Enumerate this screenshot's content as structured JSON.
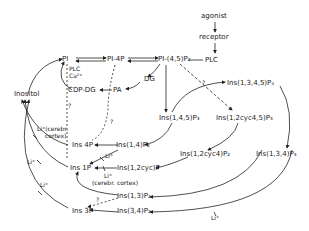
{
  "diagram": {
    "type": "metabolic-pathway",
    "nodes": {
      "agonist": "agonist",
      "receptor": "receptor",
      "plc": "PLC",
      "pi": "PI",
      "pi4p": "PI-4P",
      "pip2": "PI-(4,5)P₂",
      "plc_ca_1": "PLC",
      "plc_ca_2": "Ca²⁺",
      "cdp_dg": "CDP-DG",
      "pa": "PA",
      "dg": "DG",
      "inositol": "Inositol",
      "ins1345p4": "Ins(1,3,4,5)P₄",
      "ins145p3": "Ins(1,4,5)P₃",
      "ins12cyc45p3": "Ins(1,2cyc4,5)P₃",
      "ins14p2": "Ins(1,4)P₂",
      "ins12cyc4p2": "Ins(1,2cyc4)P₂",
      "ins134p3": "Ins(1,3,4)P₃",
      "ins4p": "Ins 4P",
      "ins1p": "Ins 1P",
      "ins12cycp": "Ins(1,2cyc)P",
      "ins13p2": "Ins(1,3)P₂",
      "ins34p2": "Ins(3,4)P₂",
      "ins3p": "Ins 3P"
    },
    "annotations": {
      "li_cerebr_1": "Li⁺(cerebr.",
      "li_cerebr_2": "cortex)",
      "li_1": "Li⁺",
      "li_2": "Li⁺",
      "li_3": "Li⁺",
      "li_4": "Li⁺",
      "li_5": "Li⁺",
      "li_cerebr_b": "(cerebr. cortex)",
      "question": "?"
    }
  }
}
